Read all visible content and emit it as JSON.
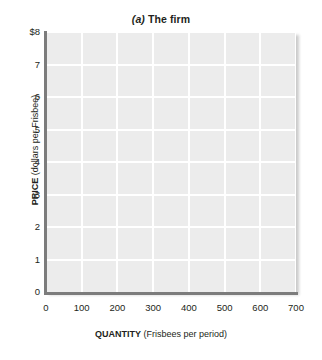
{
  "chart_data": {
    "type": "line",
    "title": "(a) The firm",
    "title_panel_letter": "(a)",
    "title_text": "The firm",
    "xlabel_strong": "QUANTITY",
    "xlabel_unit": "(Frisbees per period)",
    "ylabel_strong": "PRICE",
    "ylabel_unit": "(dollars per Frisbee)",
    "xlabel": "QUANTITY (Frisbees per period)",
    "ylabel": "PRICE (dollars per Frisbee)",
    "xlim": [
      0,
      700
    ],
    "ylim": [
      0,
      8
    ],
    "xticks": [
      0,
      100,
      200,
      300,
      400,
      500,
      600,
      700
    ],
    "xtick_labels": [
      "0",
      "100",
      "200",
      "300",
      "400",
      "500",
      "600",
      "700"
    ],
    "yticks": [
      0,
      1,
      2,
      3,
      4,
      5,
      6,
      7,
      8
    ],
    "ytick_labels": [
      "0",
      "1",
      "2",
      "3",
      "4",
      "5",
      "6",
      "7",
      "$8"
    ],
    "grid": true,
    "legend": null,
    "series": [],
    "annotations": [],
    "plot_background_color": "#ececec",
    "gridline_color": "#ffffff",
    "axis_color": "#7c7c7c",
    "text_color": "#231f20",
    "note": "Empty coordinate grid; no data series plotted."
  }
}
